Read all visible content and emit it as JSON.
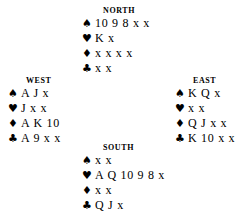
{
  "diagram": {
    "background_color": "#ffffff",
    "text_color": "#000000"
  },
  "suits": {
    "spade": {
      "name": "spade-suit-symbol",
      "glyph": "♠"
    },
    "heart": {
      "name": "heart-suit-symbol",
      "glyph": "♥"
    },
    "diamond": {
      "name": "diamond-suit-symbol",
      "glyph": "♦"
    },
    "club": {
      "name": "club-suit-symbol",
      "glyph": "♣"
    }
  },
  "hands": {
    "north": {
      "label": "NORTH",
      "spades": "10 9 8 x x",
      "hearts": "K x",
      "diamonds": "x x x x",
      "clubs": "x x"
    },
    "west": {
      "label": "WEST",
      "spades": "A J x",
      "hearts": "J x x",
      "diamonds": "A K 10",
      "clubs": "A 9 x x"
    },
    "east": {
      "label": "EAST",
      "spades": "K Q x",
      "hearts": "x x",
      "diamonds": "Q J x x",
      "clubs": "K 10 x x"
    },
    "south": {
      "label": "SOUTH",
      "spades": "x x",
      "hearts": "A Q 10 9 8 x",
      "diamonds": "x x",
      "clubs": "Q J x"
    }
  }
}
